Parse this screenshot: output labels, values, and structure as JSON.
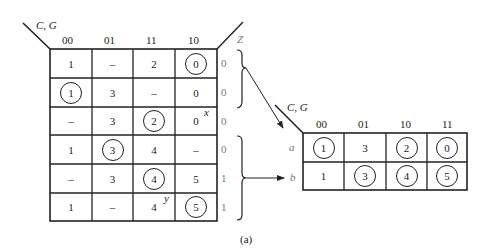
{
  "caption": "(a)",
  "left_table": {
    "corner_label": "C, G",
    "columns": [
      "00",
      "01",
      "11",
      "10"
    ],
    "z_header": "Z",
    "rows": [
      {
        "cells": [
          {
            "v": "1",
            "c": false
          },
          {
            "v": "–",
            "c": false
          },
          {
            "v": "2",
            "c": false
          },
          {
            "v": "0",
            "c": true
          }
        ],
        "z": "0"
      },
      {
        "cells": [
          {
            "v": "1",
            "c": true
          },
          {
            "v": "3",
            "c": false
          },
          {
            "v": "–",
            "c": false
          },
          {
            "v": "0",
            "c": false
          }
        ],
        "z": "0"
      },
      {
        "cells": [
          {
            "v": "–",
            "c": false
          },
          {
            "v": "3",
            "c": false
          },
          {
            "v": "2",
            "c": true
          },
          {
            "v": "0",
            "c": false
          }
        ],
        "z": "0"
      },
      {
        "cells": [
          {
            "v": "1",
            "c": false
          },
          {
            "v": "3",
            "c": true
          },
          {
            "v": "4",
            "c": false
          },
          {
            "v": "–",
            "c": false
          }
        ],
        "z": "0"
      },
      {
        "cells": [
          {
            "v": "–",
            "c": false
          },
          {
            "v": "3",
            "c": false
          },
          {
            "v": "4",
            "c": true
          },
          {
            "v": "5",
            "c": false
          }
        ],
        "z": "1"
      },
      {
        "cells": [
          {
            "v": "1",
            "c": false
          },
          {
            "v": "–",
            "c": false
          },
          {
            "v": "4",
            "c": false
          },
          {
            "v": "5",
            "c": true
          }
        ],
        "z": "1"
      }
    ],
    "annotations": {
      "x": "x",
      "y": "y"
    }
  },
  "right_table": {
    "corner_label": "C, G",
    "columns": [
      "00",
      "01",
      "10",
      "11"
    ],
    "rows": [
      {
        "label": "a",
        "cells": [
          {
            "v": "1",
            "c": true
          },
          {
            "v": "3",
            "c": false
          },
          {
            "v": "2",
            "c": true
          },
          {
            "v": "0",
            "c": true
          }
        ]
      },
      {
        "label": "b",
        "cells": [
          {
            "v": "1",
            "c": false
          },
          {
            "v": "3",
            "c": true
          },
          {
            "v": "4",
            "c": true
          },
          {
            "v": "5",
            "c": true
          }
        ]
      }
    ]
  }
}
